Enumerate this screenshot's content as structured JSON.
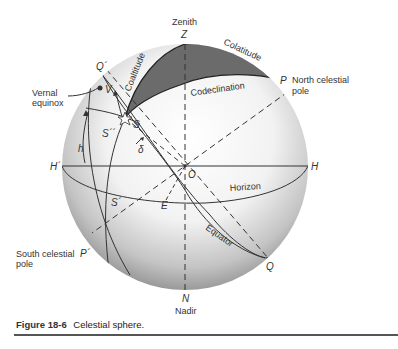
{
  "figure": {
    "number": "Figure 18-6",
    "title": "Celestial sphere."
  },
  "labels": {
    "zenith": "Zenith",
    "Z": "Z",
    "nadir": "Nadir",
    "N": "N",
    "P": "P",
    "north_pole": "North celestial",
    "north_pole_2": "pole",
    "P_prime": "P´",
    "south_pole": "South celestial",
    "south_pole_2": "pole",
    "H": "H",
    "H_prime": "H´",
    "O": "O",
    "E": "E",
    "Q": "Q",
    "Q_prime": "Q´",
    "V": "V",
    "S": "S",
    "S_prime": "S´",
    "S_dprime": "S´´",
    "h": "h",
    "delta": "δ",
    "vernal": "Vernal",
    "equinox": "equinox",
    "colatitude": "Colatitude",
    "coaltitude": "Coaltitude",
    "codeclination": "Codeclination",
    "horizon": "Horizon",
    "equator": "Equator"
  },
  "colors": {
    "triangle_fill": "#6b6b6b",
    "sphere_light": "#ffffff",
    "sphere_dark": "#9a9a9a",
    "line": "#333333"
  }
}
